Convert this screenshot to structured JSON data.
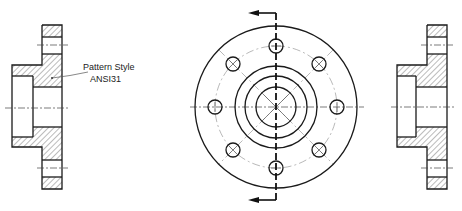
{
  "drawing": {
    "annotation": {
      "line1": "Pattern Style",
      "line2": "ANSI31"
    },
    "views": [
      {
        "name": "left-section-view",
        "hatch_pattern": "ANSI31"
      },
      {
        "name": "front-view",
        "bolt_hole_count": 8
      },
      {
        "name": "right-section-view",
        "hatch_pattern": "ANSI31"
      }
    ],
    "colors": {
      "line": "#1a1a1a",
      "hatch": "#555555",
      "background": "#ffffff"
    }
  }
}
